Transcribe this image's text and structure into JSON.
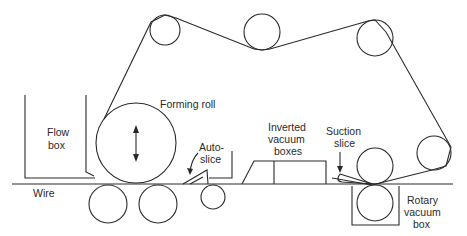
{
  "diagram": {
    "type": "paper-machine-former schematic",
    "colors": {
      "stroke": "#2a2a2a",
      "background": "#ffffff"
    },
    "labels": {
      "flow_box_1": "Flow",
      "flow_box_2": "box",
      "wire": "Wire",
      "forming_roll": "Forming roll",
      "auto_slice_1": "Auto-",
      "auto_slice_2": "slice",
      "inverted_1": "Inverted",
      "inverted_2": "vacuum",
      "inverted_3": "boxes",
      "suction_1": "Suction",
      "suction_2": "slice",
      "rotary_1": "Rotary",
      "rotary_2": "vacuum",
      "rotary_3": "box"
    },
    "components": [
      "flow-box",
      "wire",
      "forming-roll",
      "auto-slice",
      "inverted-vacuum-boxes",
      "suction-slice",
      "rotary-vacuum-box",
      "felt-guide-rolls",
      "table-rolls"
    ]
  }
}
